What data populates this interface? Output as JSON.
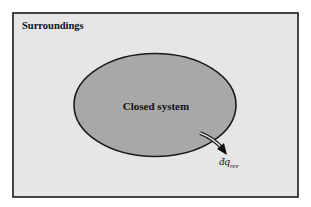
{
  "diagram": {
    "surroundings_label": "Surroundings",
    "system_label": "Closed system",
    "heat_label": {
      "main": "đq",
      "subscript": "rev"
    },
    "colors": {
      "surroundings_fill": "#e6e6e6",
      "system_fill": "#a8a8a8",
      "border": "#1a1a1a",
      "text": "#111111"
    }
  }
}
